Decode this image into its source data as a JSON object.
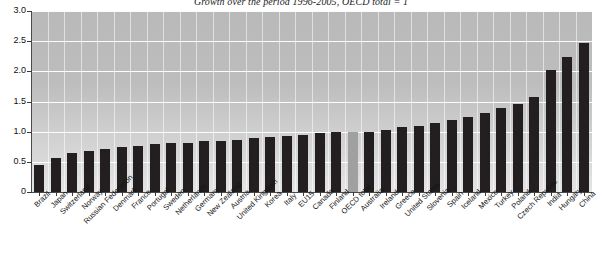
{
  "chart_data": {
    "type": "bar",
    "title": "Growth over the period 1996-2005, OECD total = 1",
    "xlabel": "",
    "ylabel": "",
    "ylim": [
      0,
      3.0
    ],
    "ytick_labels": [
      "0",
      "0.5",
      "1.0",
      "1.5",
      "2.0",
      "2.5",
      "3.0"
    ],
    "ytick_values": [
      0,
      0.5,
      1.0,
      1.5,
      2.0,
      2.5,
      3.0
    ],
    "grid": true,
    "legend": "none",
    "highlight_category": "OECD total",
    "highlight_color": "#a0a0a0",
    "bar_color": "#231f20",
    "plot_background": "#c4c4c4",
    "categories": [
      "Brazil",
      "Japan",
      "Switzerland",
      "Norway",
      "Russian Federation",
      "Denmark",
      "France",
      "Portugal",
      "Sweden",
      "Netherlands",
      "Germany",
      "New Zealand",
      "Austria",
      "United Kingdom",
      "Korea",
      "Italy",
      "EU15",
      "Canada",
      "Finland",
      "OECD total",
      "Australia",
      "Ireland",
      "Greece",
      "United States",
      "Slovenia",
      "Spain",
      "Iceland",
      "Mexico",
      "Turkey",
      "Poland",
      "Czech Republic",
      "India",
      "Hungary",
      "China"
    ],
    "values": [
      0.45,
      0.57,
      0.65,
      0.68,
      0.71,
      0.75,
      0.77,
      0.8,
      0.81,
      0.82,
      0.84,
      0.85,
      0.87,
      0.89,
      0.91,
      0.93,
      0.95,
      0.97,
      0.99,
      1.0,
      1.0,
      1.03,
      1.07,
      1.1,
      1.15,
      1.2,
      1.25,
      1.31,
      1.39,
      1.46,
      1.57,
      2.02,
      2.23,
      2.47
    ]
  }
}
